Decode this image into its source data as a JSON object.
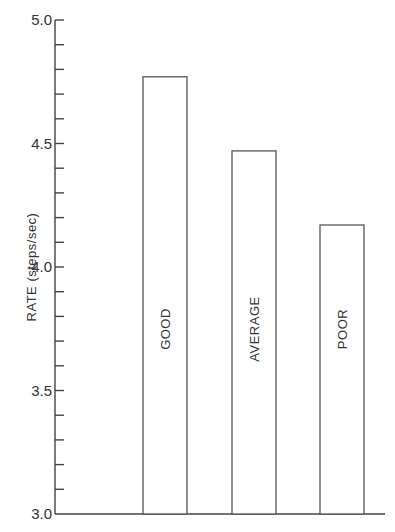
{
  "chart_data": {
    "type": "bar",
    "title": "",
    "xlabel": "",
    "ylabel": "RATE  (steps/sec)",
    "categories": [
      "GOOD",
      "AVERAGE",
      "POOR"
    ],
    "values": [
      4.77,
      4.47,
      4.17
    ],
    "ylim": [
      3.0,
      5.0
    ],
    "yticks_major": [
      "3.0",
      "3.5",
      "4.0",
      "4.5",
      "5.0"
    ],
    "ytick_minor_step": 0.1,
    "bar_labels_inside_rotated": true,
    "grid": false,
    "legend": null
  },
  "colors": {
    "axis": "#444444",
    "bar_outline": "#555555",
    "bar_fill": "#ffffff",
    "text": "#333333"
  }
}
